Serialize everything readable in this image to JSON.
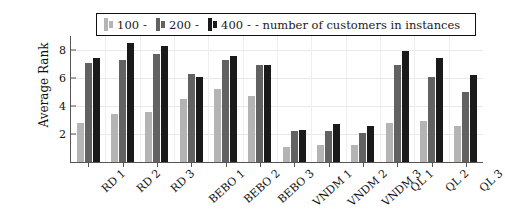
{
  "chart_data": {
    "type": "bar",
    "title": "",
    "xlabel": "",
    "ylabel": "Average Rank",
    "ylim": [
      0,
      9
    ],
    "yticks": [
      2,
      4,
      6,
      8
    ],
    "grid": true,
    "legend_position": "top",
    "legend_suffix": "- number of customers in instances",
    "categories": [
      "RD 1",
      "RD 2",
      "RD 3",
      "BEBO 1",
      "BEBO 2",
      "BEBO 3",
      "VNDM 1",
      "VNDM 2",
      "VNDM 3",
      "QL 1",
      "QL 2",
      "QL 3"
    ],
    "series": [
      {
        "name": "100 -",
        "color": "#b4b4b4",
        "values": [
          2.8,
          3.4,
          3.6,
          4.5,
          5.2,
          4.7,
          1.1,
          1.2,
          1.2,
          2.8,
          2.9,
          2.6
        ]
      },
      {
        "name": "200 -",
        "color": "#626262",
        "values": [
          7.1,
          7.3,
          7.7,
          6.3,
          7.3,
          6.9,
          2.2,
          2.2,
          2.1,
          6.9,
          6.1,
          5.0
        ]
      },
      {
        "name": "400 -",
        "color": "#1a1a1a",
        "values": [
          7.4,
          8.5,
          8.3,
          6.1,
          7.6,
          6.9,
          2.3,
          2.7,
          2.6,
          7.9,
          7.4,
          6.2
        ]
      }
    ]
  }
}
